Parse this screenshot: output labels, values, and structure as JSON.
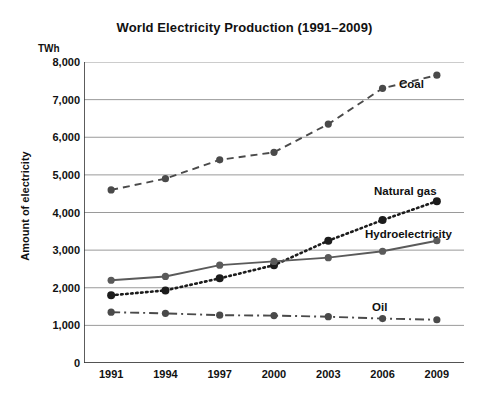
{
  "chart_data": {
    "type": "line",
    "title": "World Electricity Production (1991–2009)",
    "xlabel": "",
    "ylabel": "Amount of electricity",
    "unit_label": "TWh",
    "footnote": "TWh＝terawatt-hour(one trillion watts of energy per hour)",
    "categories": [
      "1991",
      "1994",
      "1997",
      "2000",
      "2003",
      "2006",
      "2009"
    ],
    "x": [
      1991,
      1994,
      1997,
      2000,
      2003,
      2006,
      2009
    ],
    "ylim": [
      0,
      8000
    ],
    "ytick_step": 1000,
    "ytick_labels": [
      "0",
      "1,000",
      "2,000",
      "3,000",
      "4,000",
      "5,000",
      "6,000",
      "7,000",
      "8,000"
    ],
    "ytick_values": [
      0,
      1000,
      2000,
      3000,
      4000,
      5000,
      6000,
      7000,
      8000
    ],
    "grid": true,
    "legend_position": "inline-right",
    "series": [
      {
        "name": "Coal",
        "style": "dashed",
        "color": "#4a4a4a",
        "values": [
          4600,
          4900,
          5400,
          5600,
          6350,
          7300,
          7650
        ],
        "label_x": 399,
        "label_y": 78
      },
      {
        "name": "Natural gas",
        "style": "dotted",
        "color": "#1c1c1c",
        "values": [
          1800,
          1930,
          2250,
          2600,
          3250,
          3800,
          4300
        ],
        "label_x": 374,
        "label_y": 185
      },
      {
        "name": "Hydroelectricity",
        "style": "solid",
        "color": "#5a5a5a",
        "values": [
          2200,
          2300,
          2600,
          2700,
          2800,
          2970,
          3250
        ],
        "label_x": 365,
        "label_y": 228
      },
      {
        "name": "Oil",
        "style": "dash-dot",
        "color": "#4a4a4a",
        "values": [
          1350,
          1320,
          1270,
          1260,
          1230,
          1180,
          1150
        ],
        "label_x": 372,
        "label_y": 301
      }
    ]
  }
}
